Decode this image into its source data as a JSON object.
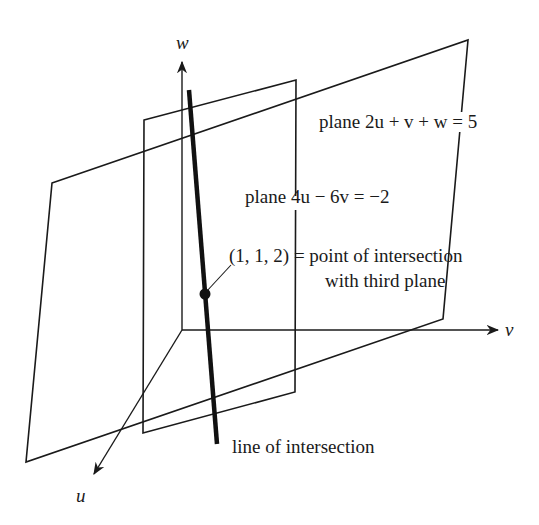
{
  "axes": {
    "w": {
      "label": "w"
    },
    "v": {
      "label": "v"
    },
    "u": {
      "label": "u"
    }
  },
  "planes": {
    "plane1": {
      "label": "plane 2u + v + w = 5",
      "equation": "2u + v + w = 5"
    },
    "plane2": {
      "label": "plane 4u − 6v = −2",
      "equation": "4u − 6v = −2"
    }
  },
  "point": {
    "coords": "(1, 1, 2)",
    "label_line1": "(1, 1, 2) = point of intersection",
    "label_line2": "with third plane"
  },
  "line": {
    "label": "line of intersection"
  },
  "colors": {
    "stroke": "#1a1a1a",
    "background": "#ffffff"
  }
}
